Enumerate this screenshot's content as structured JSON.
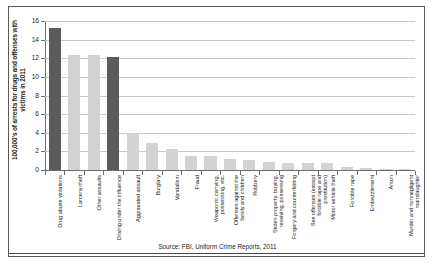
{
  "figure": {
    "caption": "Source: FBI, Uniform Crime Reports, 2011"
  },
  "chart_data": {
    "type": "bar",
    "title": "",
    "xlabel": "",
    "ylabel": "100,000's of arrests for drugs and offenses with victims in 2011",
    "ylim": [
      0,
      16
    ],
    "yticks": [
      0,
      2,
      4,
      6,
      8,
      10,
      12,
      14,
      16
    ],
    "ytick_labels": [
      "0",
      "2",
      "4",
      "6",
      "8",
      "10",
      "12",
      "14",
      "16"
    ],
    "grid": true,
    "legend": "none",
    "colors": {
      "dark_bar": "#5b5b5b",
      "light_bar": "#d3d3d3",
      "gridline": "#c9c9c9",
      "axis": "#6d6d6d",
      "frame": "#5a5a5a",
      "text": "#1c1c1c"
    },
    "categories": [
      "Drug abuse violations",
      "Larceny-theft",
      "Other assaults",
      "Driving under the influence",
      "Aggravated assault",
      "Burglary",
      "Vandalism",
      "Fraud",
      "Weapons: carrying, possessing, etc.",
      "Offenses against the family and children",
      "Robbery",
      "Stolen property: buying, receiving, possessing",
      "Forgery and counterfeiting",
      "Sex offenses (except forcible rape and prostitution)",
      "Motor vehicle theft",
      "Forcible rape",
      "Embezzlement",
      "Arson",
      "Murder and nonnegligent manslaughter"
    ],
    "values": [
      15.2,
      12.4,
      12.3,
      12.1,
      4.0,
      2.9,
      2.3,
      1.5,
      1.5,
      1.2,
      1.1,
      0.9,
      0.8,
      0.8,
      0.7,
      0.3,
      0.2,
      0.1,
      0.1
    ],
    "bar_shades": [
      "dark",
      "light",
      "light",
      "dark",
      "light",
      "light",
      "light",
      "light",
      "light",
      "light",
      "light",
      "light",
      "light",
      "light",
      "light",
      "light",
      "light",
      "light",
      "light"
    ]
  }
}
